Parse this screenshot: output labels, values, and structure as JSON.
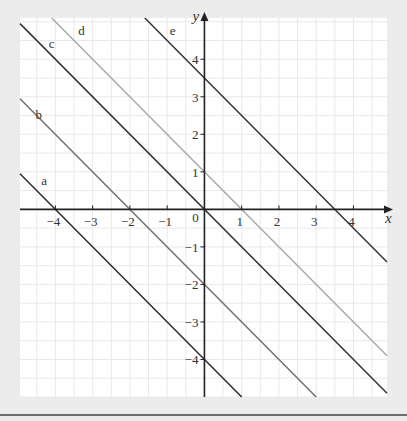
{
  "chart_data": {
    "type": "line",
    "title": "",
    "xlabel": "x",
    "ylabel": "y",
    "xlim": [
      -4.95,
      4.9
    ],
    "ylim": [
      -5.0,
      5.1
    ],
    "grid": true,
    "grid_minor_step": 0.5,
    "x_ticks": [
      -4,
      -3,
      -2,
      -1,
      0,
      1,
      2,
      3,
      4
    ],
    "x_tick_labels": [
      "−4",
      "−3",
      "−2",
      "−1",
      "0",
      "1",
      "2",
      "3",
      "4"
    ],
    "y_ticks": [
      4,
      3,
      2,
      1,
      -1,
      -2,
      -3,
      -4
    ],
    "y_tick_labels": [
      "4",
      "3",
      "2",
      "1",
      "−1",
      "−2",
      "−3",
      "−4"
    ],
    "legend": "inline labels",
    "series": [
      {
        "name": "a",
        "equation": "y = -x - 4",
        "slope": -1,
        "intercept": -4,
        "color": "#2b2b2b",
        "x": [
          -4.95,
          1.0
        ],
        "y": [
          0.95,
          -5.0
        ],
        "label_pos": [
          -4.3,
          0.65
        ]
      },
      {
        "name": "b",
        "equation": "y = -x - 2",
        "slope": -1,
        "intercept": -2,
        "color": "#707070",
        "x": [
          -4.95,
          3.0
        ],
        "y": [
          2.95,
          -5.0
        ],
        "label_pos": [
          -4.45,
          2.4
        ]
      },
      {
        "name": "c",
        "equation": "y = -x",
        "slope": -1,
        "intercept": 0,
        "color": "#333333",
        "x": [
          -4.95,
          4.9
        ],
        "y": [
          4.95,
          -4.9
        ],
        "label_pos": [
          -4.1,
          4.3
        ]
      },
      {
        "name": "d",
        "equation": "y = -x + 1",
        "slope": -1,
        "intercept": 1,
        "color": "#a9a9a9",
        "x": [
          -4.1,
          4.9
        ],
        "y": [
          5.1,
          -3.9
        ],
        "label_pos": [
          -3.3,
          4.65
        ]
      },
      {
        "name": "e",
        "equation": "y = -x + 3.5",
        "slope": -1,
        "intercept": 3.5,
        "color": "#333333",
        "x": [
          -1.6,
          4.9
        ],
        "y": [
          5.1,
          -1.4
        ],
        "label_pos": [
          -0.85,
          4.65
        ]
      }
    ]
  },
  "axes": {
    "x_label": "x",
    "y_label": "y",
    "origin_label": "0"
  }
}
